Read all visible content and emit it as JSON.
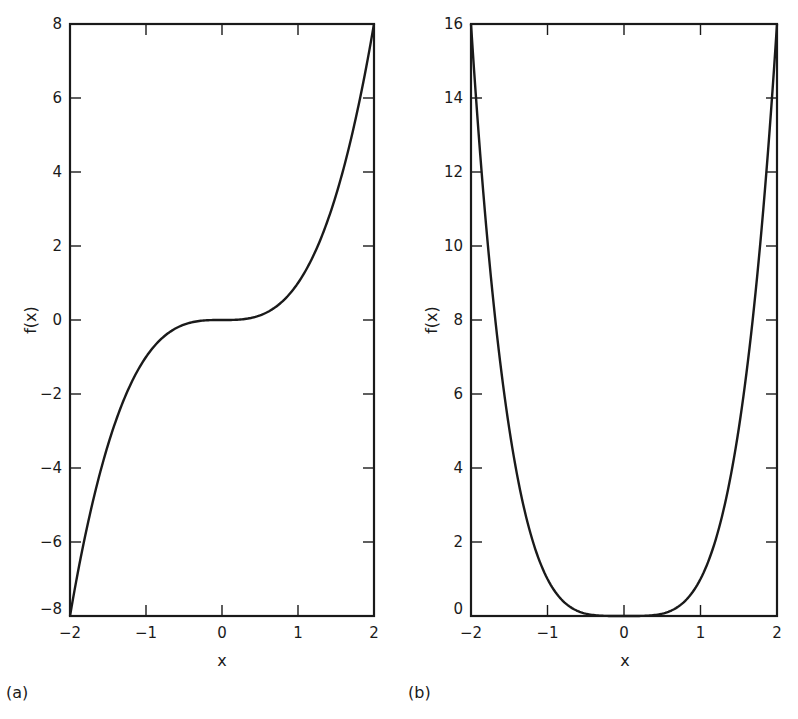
{
  "chart_data": [
    {
      "panel_label": "(a)",
      "type": "line",
      "title": "",
      "function": "f(x) = x^3",
      "xlabel": "x",
      "ylabel": "f(x)",
      "xlim": [
        -2,
        2
      ],
      "ylim": [
        -8,
        8
      ],
      "xticks": [
        -2,
        -1,
        0,
        1,
        2
      ],
      "yticks": [
        -8,
        -6,
        -4,
        -2,
        0,
        2,
        4,
        6,
        8
      ],
      "xtick_labels": [
        "−2",
        "−1",
        "0",
        "1",
        "2"
      ],
      "ytick_labels": [
        "−8",
        "−6",
        "−4",
        "−2",
        "0",
        "2",
        "4",
        "6",
        "8"
      ],
      "grid": false,
      "legend": null,
      "series": [
        {
          "name": "f(x)",
          "x": [
            -2,
            -1.75,
            -1.5,
            -1.25,
            -1,
            -0.75,
            -0.5,
            -0.25,
            0,
            0.25,
            0.5,
            0.75,
            1,
            1.25,
            1.5,
            1.75,
            2
          ],
          "y": [
            -8,
            -5.359,
            -3.375,
            -1.953,
            -1,
            -0.422,
            -0.125,
            -0.016,
            0,
            0.016,
            0.125,
            0.422,
            1,
            1.953,
            3.375,
            5.359,
            8
          ]
        }
      ]
    },
    {
      "panel_label": "(b)",
      "type": "line",
      "title": "",
      "function": "f(x) = x^4",
      "xlabel": "x",
      "ylabel": "f(x)",
      "xlim": [
        -2,
        2
      ],
      "ylim": [
        0,
        16
      ],
      "xticks": [
        -2,
        -1,
        0,
        1,
        2
      ],
      "yticks": [
        0,
        2,
        4,
        6,
        8,
        10,
        12,
        14,
        16
      ],
      "xtick_labels": [
        "−2",
        "−1",
        "0",
        "1",
        "2"
      ],
      "ytick_labels": [
        "0",
        "2",
        "4",
        "6",
        "8",
        "10",
        "12",
        "14",
        "16"
      ],
      "grid": false,
      "legend": null,
      "series": [
        {
          "name": "f(x)",
          "x": [
            -2,
            -1.75,
            -1.5,
            -1.25,
            -1,
            -0.75,
            -0.5,
            -0.25,
            0,
            0.25,
            0.5,
            0.75,
            1,
            1.25,
            1.5,
            1.75,
            2
          ],
          "y": [
            16,
            9.379,
            5.063,
            2.441,
            1,
            0.316,
            0.063,
            0.004,
            0,
            0.004,
            0.063,
            0.316,
            1,
            2.441,
            5.063,
            9.379,
            16
          ]
        }
      ]
    }
  ]
}
